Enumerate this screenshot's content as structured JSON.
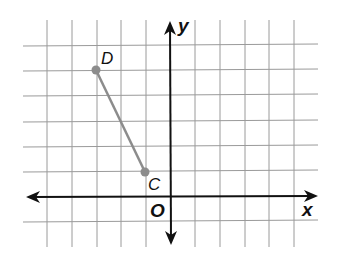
{
  "diagram": {
    "type": "coordinate-grid",
    "axes": {
      "x_label": "x",
      "y_label": "y",
      "origin_label": "O"
    },
    "grid": {
      "x_range": [
        -6,
        6
      ],
      "y_range": [
        -1,
        6
      ],
      "unit": 1
    },
    "points": [
      {
        "label": "D",
        "x": -3,
        "y": 5
      },
      {
        "label": "C",
        "x": -1,
        "y": 1
      }
    ],
    "segments": [
      {
        "from": "D",
        "to": "C"
      }
    ],
    "colors": {
      "grid": "#9a9a9a",
      "axis": "#111111",
      "segment": "#8c8c8c",
      "point": "#8c8c8c"
    }
  }
}
